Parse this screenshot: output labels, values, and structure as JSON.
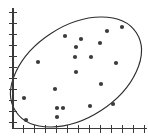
{
  "chart_data": {
    "type": "scatter",
    "title": "",
    "subtitle": "",
    "xlabel": "",
    "ylabel": "",
    "grid": false,
    "legend": null,
    "xlim": [
      0,
      13
    ],
    "ylim": [
      0,
      12
    ],
    "axes": {
      "x_axis_tick_count": 13,
      "y_axis_tick_count": 11,
      "x_tick_spacing_px": 10,
      "y_tick_spacing_px": 10,
      "x_axis_y_px": 128,
      "y_axis_x_px": 13
    },
    "point_count": 20,
    "points": [
      {
        "x": 5.2,
        "y": 9.2
      },
      {
        "x": 6.8,
        "y": 8.9
      },
      {
        "x": 9.4,
        "y": 9.7
      },
      {
        "x": 10.9,
        "y": 10.1
      },
      {
        "x": 6.3,
        "y": 8.1
      },
      {
        "x": 8.7,
        "y": 8.5
      },
      {
        "x": 6.2,
        "y": 7.1
      },
      {
        "x": 7.8,
        "y": 7.1
      },
      {
        "x": 10.3,
        "y": 6.5
      },
      {
        "x": 2.5,
        "y": 6.6
      },
      {
        "x": 6.3,
        "y": 5.6
      },
      {
        "x": 8.8,
        "y": 4.4
      },
      {
        "x": 4.2,
        "y": 3.9
      },
      {
        "x": 1.1,
        "y": 3.0
      },
      {
        "x": 7.7,
        "y": 2.2
      },
      {
        "x": 10.0,
        "y": 2.4
      },
      {
        "x": 4.4,
        "y": 2.0
      },
      {
        "x": 5.0,
        "y": 2.0
      },
      {
        "x": 4.4,
        "y": 1.1
      },
      {
        "x": 1.3,
        "y": 0.8
      }
    ],
    "points_px": [
      {
        "cx": 65,
        "cy": 36
      },
      {
        "cx": 81,
        "cy": 39
      },
      {
        "cx": 107,
        "cy": 31
      },
      {
        "cx": 122,
        "cy": 27
      },
      {
        "cx": 76,
        "cy": 47
      },
      {
        "cx": 100,
        "cy": 43
      },
      {
        "cx": 75,
        "cy": 57
      },
      {
        "cx": 91,
        "cy": 57
      },
      {
        "cx": 116,
        "cy": 63
      },
      {
        "cx": 38,
        "cy": 62
      },
      {
        "cx": 76,
        "cy": 72
      },
      {
        "cx": 101,
        "cy": 84
      },
      {
        "cx": 55,
        "cy": 89
      },
      {
        "cx": 24,
        "cy": 98
      },
      {
        "cx": 90,
        "cy": 106
      },
      {
        "cx": 113,
        "cy": 104
      },
      {
        "cx": 57,
        "cy": 108
      },
      {
        "cx": 63,
        "cy": 108
      },
      {
        "cx": 57,
        "cy": 117
      },
      {
        "cx": 26,
        "cy": 120
      }
    ],
    "annotations": [
      {
        "name": "confidence-ellipse",
        "shape": "ellipse",
        "center_px": [
          76,
          72
        ],
        "radius_x_px": 72,
        "radius_y_px": 46,
        "rotation_deg": -33,
        "filled": false
      }
    ],
    "colors": {
      "point": "#3c3c3c",
      "ellipse": "#2e2e2e",
      "axis": "#3a3a3a",
      "background": "#ffffff"
    }
  },
  "figure": {
    "caption": "",
    "point_radius_px": 2.1
  }
}
